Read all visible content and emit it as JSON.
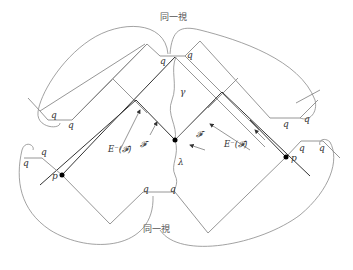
{
  "labels": {
    "identify_top": "同一視",
    "identify_bottom": "同一視",
    "gamma": "γ",
    "lambda": "λ",
    "p_left": "p",
    "p_right": "p",
    "q": "q",
    "F_left": "𝓕",
    "F_right": "𝓕",
    "E_minus_F_left": "E⁻(𝓕)",
    "E_minus_F_right": "E⁻(𝓕)"
  },
  "colors": {
    "line": "#8a8a8a",
    "dark_line": "#333333",
    "point": "#000000",
    "text": "#333333"
  }
}
